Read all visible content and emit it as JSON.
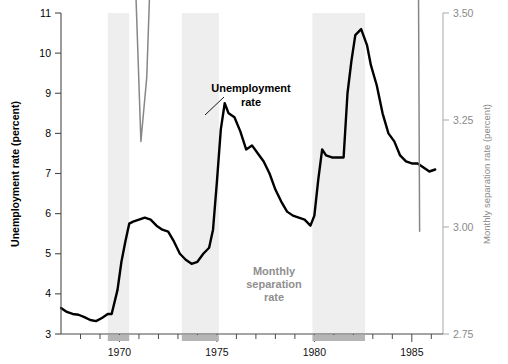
{
  "chart_data": {
    "type": "line",
    "title": "",
    "xlabel": "",
    "ylabel": "Unemployment rate (percent)",
    "y2label": "Monthly separation rate (percent)",
    "xlim": [
      1967.0,
      1986.6
    ],
    "ylim": [
      3,
      11
    ],
    "y2lim": [
      2.75,
      3.5
    ],
    "grid": false,
    "legend_position": "inline-annotations",
    "y_ticks": [
      "3",
      "4",
      "5",
      "6",
      "7",
      "8",
      "9",
      "10",
      "11"
    ],
    "y2_ticks": [
      "2.75",
      "3.00",
      "3.25",
      "3.50"
    ],
    "x_ticks": [
      "1970",
      "1975",
      "1980",
      "1985"
    ],
    "x_tick_values": [
      1970,
      1975,
      1980,
      1985
    ],
    "minor_tick_interval_years": 1,
    "annotations": [
      {
        "name": "unemployment-rate-label",
        "text": "Unemployment\nrate",
        "line1": "Unemployment",
        "line2": "rate",
        "color": "#000000",
        "x": 1975.9,
        "y": 9.25,
        "leader_to_x": 1974.7,
        "leader_to_y": 8.62
      },
      {
        "name": "monthly-separation-rate-label",
        "text": "Monthly\nseparation\nrate",
        "line1": "Monthly",
        "line2": "separation",
        "line3": "rate",
        "color": "#8f8f8f",
        "x": 1977.3,
        "y": 4.3
      }
    ],
    "recession_bands": [
      {
        "name": "recession-1969-1970",
        "start": 1969.4,
        "end": 1970.5
      },
      {
        "name": "recession-1973-1975",
        "start": 1973.2,
        "end": 1975.1
      },
      {
        "name": "recession-1980-1982",
        "start": 1979.9,
        "end": 1982.6
      }
    ],
    "series": [
      {
        "name": "Unemployment rate",
        "axis": "left",
        "color": "#000000",
        "width": 2.4,
        "x": [
          1967.0,
          1967.3,
          1967.6,
          1967.9,
          1968.2,
          1968.5,
          1968.8,
          1969.1,
          1969.4,
          1969.6,
          1969.9,
          1970.1,
          1970.3,
          1970.5,
          1970.7,
          1971.0,
          1971.3,
          1971.6,
          1971.9,
          1972.2,
          1972.5,
          1972.8,
          1973.1,
          1973.4,
          1973.7,
          1974.0,
          1974.3,
          1974.6,
          1974.8,
          1975.0,
          1975.2,
          1975.4,
          1975.6,
          1975.9,
          1976.2,
          1976.5,
          1976.8,
          1977.1,
          1977.4,
          1977.7,
          1978.0,
          1978.3,
          1978.6,
          1978.9,
          1979.2,
          1979.5,
          1979.8,
          1980.0,
          1980.2,
          1980.4,
          1980.6,
          1980.9,
          1981.2,
          1981.5,
          1981.7,
          1981.9,
          1982.1,
          1982.4,
          1982.7,
          1982.9,
          1983.2,
          1983.5,
          1983.8,
          1984.1,
          1984.4,
          1984.7,
          1985.0,
          1985.3,
          1985.6,
          1985.9,
          1986.2
        ],
        "y": [
          3.65,
          3.55,
          3.5,
          3.48,
          3.42,
          3.35,
          3.32,
          3.4,
          3.5,
          3.5,
          4.1,
          4.8,
          5.3,
          5.75,
          5.8,
          5.85,
          5.9,
          5.85,
          5.7,
          5.6,
          5.55,
          5.3,
          5.0,
          4.85,
          4.75,
          4.8,
          5.0,
          5.15,
          5.6,
          6.8,
          8.1,
          8.75,
          8.5,
          8.4,
          8.05,
          7.6,
          7.7,
          7.5,
          7.3,
          7.0,
          6.6,
          6.3,
          6.05,
          5.95,
          5.9,
          5.85,
          5.7,
          5.95,
          6.85,
          7.6,
          7.45,
          7.4,
          7.4,
          7.4,
          9.0,
          9.8,
          10.45,
          10.6,
          10.2,
          9.7,
          9.2,
          8.5,
          8.0,
          7.8,
          7.45,
          7.3,
          7.25,
          7.25,
          7.15,
          7.05,
          7.1
        ]
      },
      {
        "name": "Monthly separation rate",
        "axis": "right",
        "color": "#878787",
        "width": 1.5,
        "x": [
          1967.0,
          1967.3,
          1967.5,
          1967.8,
          1968.1,
          1968.3,
          1968.6,
          1968.9,
          1969.2,
          1969.4,
          1969.7,
          1969.9,
          1970.2,
          1970.5,
          1970.8,
          1971.1,
          1971.4,
          1971.7,
          1972.0,
          1972.3,
          1972.6,
          1972.9,
          1973.1,
          1973.4,
          1973.6,
          1973.8,
          1974.0,
          1974.3,
          1974.6,
          1974.9,
          1975.1,
          1975.4,
          1975.7,
          1976.0,
          1976.3,
          1976.6,
          1976.9,
          1977.1,
          1977.3,
          1977.5,
          1977.8,
          1978.0,
          1978.3,
          1978.6,
          1978.9,
          1979.1,
          1979.4,
          1979.7,
          1980.0,
          1980.2,
          1980.4,
          1980.6,
          1980.8,
          1981.0,
          1981.3,
          1981.6,
          1981.9,
          1982.2,
          1982.5,
          1982.8,
          1983.1,
          1983.4,
          1983.7,
          1984.0,
          1984.3,
          1984.6,
          1984.9,
          1985.1,
          1985.4
        ],
        "y": [
          6.1,
          5.2,
          5.05,
          5.1,
          5.45,
          5.25,
          5.05,
          5.0,
          5.3,
          5.75,
          6.1,
          5.85,
          4.9,
          4.1,
          3.6,
          3.2,
          3.35,
          3.75,
          3.9,
          4.0,
          4.3,
          4.45,
          4.15,
          3.7,
          4.4,
          4.85,
          5.1,
          5.9,
          7.1,
          8.2,
          7.5,
          6.3,
          5.7,
          5.65,
          4.8,
          5.05,
          4.9,
          5.35,
          4.95,
          5.25,
          4.85,
          5.2,
          5.9,
          6.0,
          5.85,
          6.05,
          5.95,
          6.1,
          7.6,
          6.6,
          5.6,
          4.7,
          5.2,
          9.6,
          10.7,
          10.4,
          10.1,
          9.2,
          8.35,
          8.2,
          8.0,
          7.7,
          8.0,
          9.9,
          8.5,
          6.8,
          6.0,
          5.95,
          2.99
        ]
      }
    ]
  }
}
